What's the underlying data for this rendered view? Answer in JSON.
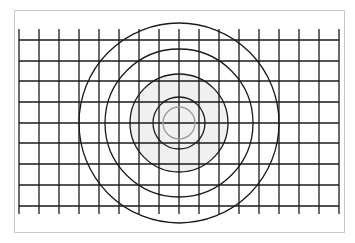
{
  "diagram": {
    "title": "",
    "type": "grid-with-concentric-circles",
    "frame": {
      "x": 14,
      "y": 10,
      "width": 331,
      "height": 223,
      "border_color": "#c8c8c8"
    },
    "grid": {
      "vertical_lines_x": [
        19,
        39,
        59,
        79,
        99,
        119,
        139,
        159,
        179,
        199,
        219,
        239,
        259,
        279,
        299,
        319,
        339
      ],
      "vertical_span_y": [
        29,
        214
      ],
      "horizontal_lines_y": [
        40,
        61,
        81,
        102,
        123,
        143,
        164,
        185,
        206
      ],
      "horizontal_span_x": [
        19,
        339
      ],
      "line_color": "#1a1a1a"
    },
    "center": {
      "x": 179,
      "y": 123
    },
    "filled_disc": {
      "r": 49,
      "color": "#f0f0f0"
    },
    "circles": [
      {
        "r": 16,
        "color": "#9a9a9a"
      },
      {
        "r": 26,
        "color": "#1a1a1a"
      },
      {
        "r": 49,
        "color": "#1a1a1a"
      },
      {
        "r": 74,
        "color": "#1a1a1a"
      },
      {
        "r": 100,
        "color": "#1a1a1a"
      }
    ]
  }
}
